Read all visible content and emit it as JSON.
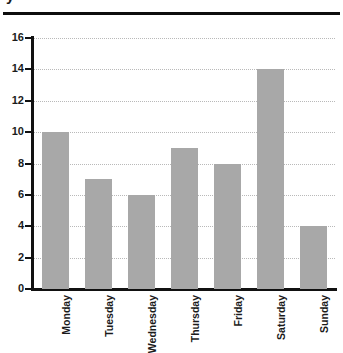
{
  "title": {
    "text_fragment": "y",
    "note_visible": "title is cropped off at the top edge"
  },
  "axis": {
    "y_ticks": [
      "0",
      "2",
      "4",
      "6",
      "8",
      "10",
      "12",
      "14",
      "16"
    ],
    "y_min": 0,
    "y_max": 16
  },
  "colors": {
    "bar_fill": "#a8a8a8",
    "axis": "#111111",
    "gridline": "#b9b9b9",
    "text": "#1b1b1b",
    "rule": "#0d0d0d",
    "background": "#ffffff"
  },
  "chart_data": {
    "type": "bar",
    "title": "y",
    "xlabel": "",
    "ylabel": "",
    "categories": [
      "Monday",
      "Tuesday",
      "Wednesday",
      "Thursday",
      "Friday",
      "Saturday",
      "Sunday"
    ],
    "values": [
      10,
      7,
      6,
      9,
      8,
      14,
      4
    ],
    "ylim": [
      0,
      16
    ],
    "ytick_step": 2,
    "yticks": [
      0,
      2,
      4,
      6,
      8,
      10,
      12,
      14,
      16
    ],
    "grid": "horizontal-dotted",
    "legend": "none",
    "bar_color": "#a8a8a8",
    "xtick_rotation": 90
  }
}
